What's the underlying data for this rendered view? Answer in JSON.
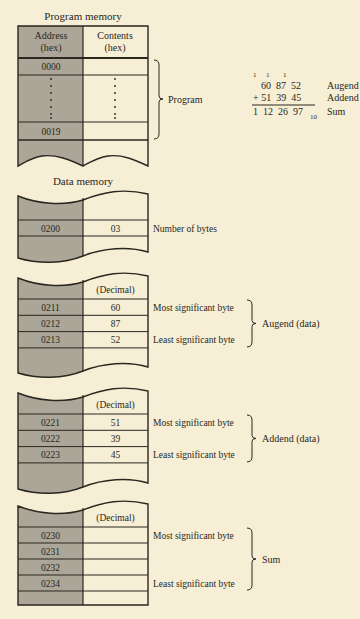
{
  "program_memory": {
    "title": "Program memory",
    "header_address": [
      "Address",
      "(hex)"
    ],
    "header_contents": [
      "Contents",
      "(hex)"
    ],
    "rows": [
      {
        "address": "0000",
        "contents": ""
      },
      {
        "address": ":",
        "contents": ":"
      },
      {
        "address": "0019",
        "contents": ""
      }
    ],
    "bracket_label": "Program"
  },
  "addition_example": {
    "carries": [
      "1",
      "1",
      "1"
    ],
    "augend": "60  87  52",
    "addend": "+ 51  39  45",
    "sum": "1  12  26  97",
    "sum_subscript": "10",
    "labels": {
      "augend": "Augend",
      "addend": "Addend",
      "sum": "Sum"
    }
  },
  "data_memory": {
    "title": "Data memory",
    "blocks": [
      {
        "header": "",
        "rows": [
          {
            "address": "0200",
            "value": "03",
            "note": "Number of bytes"
          }
        ]
      },
      {
        "header": "(Decimal)",
        "rows": [
          {
            "address": "0211",
            "value": "60",
            "note": "Most significant byte"
          },
          {
            "address": "0212",
            "value": "87",
            "note": ""
          },
          {
            "address": "0213",
            "value": "52",
            "note": "Least significant byte"
          }
        ],
        "bracket_label": "Augend (data)"
      },
      {
        "header": "(Decimal)",
        "rows": [
          {
            "address": "0221",
            "value": "51",
            "note": "Most significant byte"
          },
          {
            "address": "0222",
            "value": "39",
            "note": ""
          },
          {
            "address": "0223",
            "value": "45",
            "note": "Least significant byte"
          }
        ],
        "bracket_label": "Addend (data)"
      },
      {
        "header": "(Decimal)",
        "rows": [
          {
            "address": "0230",
            "value": "",
            "note": "Most significant byte"
          },
          {
            "address": "0231",
            "value": "",
            "note": ""
          },
          {
            "address": "0232",
            "value": "",
            "note": ""
          },
          {
            "address": "0234",
            "value": "",
            "note": "Least significant byte"
          }
        ],
        "bracket_label": "Sum"
      }
    ]
  },
  "colors": {
    "background": "#f6efd6",
    "address_column": "#aba698",
    "line": "#2a2620"
  }
}
